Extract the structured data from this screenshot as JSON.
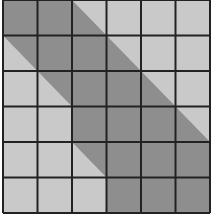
{
  "figure": {
    "rows": 6,
    "cols": 6,
    "grid_origin_px": [
      3,
      0
    ],
    "grid_size_px": [
      207,
      213
    ],
    "colors": {
      "background": "#c9c9c9",
      "band": "#8e8e8e",
      "grid_line": "#222222",
      "page": "#ffffff"
    },
    "band_polygon_grid_units": [
      [
        0,
        0
      ],
      [
        2,
        0
      ],
      [
        6,
        4
      ],
      [
        6,
        6
      ],
      [
        3,
        6
      ],
      [
        3,
        5
      ],
      [
        2,
        4
      ],
      [
        2,
        3
      ],
      [
        0,
        1
      ]
    ]
  }
}
